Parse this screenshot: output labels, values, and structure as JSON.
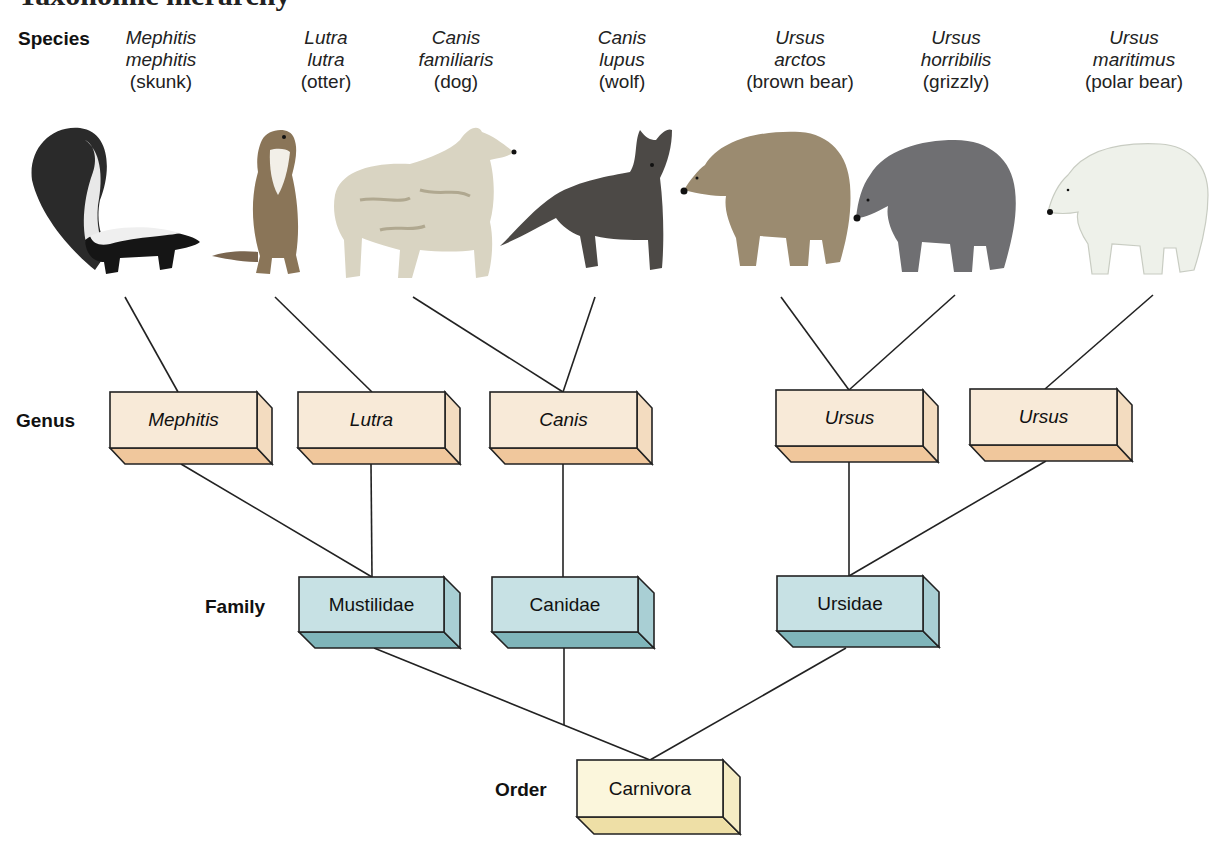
{
  "title": "Taxonomic hierarchy",
  "ranks": {
    "species": "Species",
    "genus": "Genus",
    "family": "Family",
    "order": "Order"
  },
  "species": [
    {
      "sci1": "Mephitis",
      "sci2": "mephitis",
      "common": "(skunk)",
      "x": 161,
      "color": "#1e1e1e"
    },
    {
      "sci1": "Lutra",
      "sci2": "lutra",
      "common": "(otter)",
      "x": 328,
      "color": "#8a7558"
    },
    {
      "sci1": "Canis",
      "sci2": "familiaris",
      "common": "(dog)",
      "x": 456,
      "color": "#d8d2c0"
    },
    {
      "sci1": "Canis",
      "sci2": "lupus",
      "common": "(wolf)",
      "x": 622,
      "color": "#4a4744"
    },
    {
      "sci1": "Ursus",
      "sci2": "arctos",
      "common": "(brown bear)",
      "x": 800,
      "color": "#9a8a70"
    },
    {
      "sci1": "Ursus",
      "sci2": "horribilis",
      "common": "(grizzly)",
      "x": 956,
      "color": "#6e6e70"
    },
    {
      "sci1": "Ursus",
      "sci2": "maritimus",
      "common": "(polar bear)",
      "x": 1132,
      "color": "#ecefe8"
    }
  ],
  "genus": [
    {
      "label": "Mephitis",
      "x": 110,
      "y": 392
    },
    {
      "label": "Lutra",
      "x": 298,
      "y": 392
    },
    {
      "label": "Canis",
      "x": 490,
      "y": 392
    },
    {
      "label": "Ursus",
      "x": 776,
      "y": 390
    },
    {
      "label": "Ursus",
      "x": 970,
      "y": 389
    }
  ],
  "family": [
    {
      "label": "Mustilidae",
      "x": 299,
      "y": 577
    },
    {
      "label": "Canidae",
      "x": 492,
      "y": 577
    },
    {
      "label": "Ursidae",
      "x": 777,
      "y": 576
    }
  ],
  "order": [
    {
      "label": "Carnivora",
      "x": 577,
      "y": 760
    }
  ],
  "colors": {
    "genus_front": "#f8ead8",
    "genus_side": "#f3dcc0",
    "genus_bottom": "#f0c79c",
    "family_front": "#c7e1e4",
    "family_side": "#a9cfd4",
    "family_bottom": "#7fb5ba",
    "order_front": "#fbf6dc",
    "order_side": "#f5ecc4",
    "order_bottom": "#eedfa6",
    "line": "#222222"
  }
}
